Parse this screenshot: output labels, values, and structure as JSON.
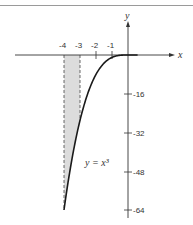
{
  "chart_data": {
    "type": "line",
    "title": "",
    "xlabel": "x",
    "ylabel": "y",
    "xlim": [
      -4.2,
      2.8
    ],
    "ylim": [
      -66,
      8
    ],
    "grid": false,
    "series": [
      {
        "name": "y = x^3",
        "x": [
          -4,
          -3.5,
          -3,
          -2.5,
          -2,
          -1.5,
          -1,
          -0.5,
          0
        ],
        "values": [
          -64,
          -42.875,
          -27,
          -15.625,
          -8,
          -3.375,
          -1,
          -0.125,
          0
        ]
      }
    ],
    "x_ticks": [
      {
        "value": -4,
        "label": "-4"
      },
      {
        "value": -3,
        "label": "-3"
      },
      {
        "value": -2,
        "label": "-2"
      },
      {
        "value": -1,
        "label": "-1"
      }
    ],
    "y_ticks": [
      {
        "value": -16,
        "label": "-16"
      },
      {
        "value": -32,
        "label": "-32"
      },
      {
        "value": -48,
        "label": "-48"
      },
      {
        "value": -64,
        "label": "-64"
      }
    ],
    "shaded_region": {
      "x_from": -4,
      "x_to": -3,
      "between": "x-axis and curve",
      "boundary_style": "dashed"
    },
    "annotations": [
      {
        "text": "y = x³",
        "x": -2.3,
        "y": -44
      }
    ]
  },
  "labels": {
    "x_axis": "x",
    "y_axis": "y",
    "equation": "y = x³",
    "x_ticks": [
      "-4",
      "-3",
      "-2",
      "-1"
    ],
    "y_ticks": [
      "-16",
      "-32",
      "-48",
      "-64"
    ]
  },
  "colors": {
    "curve": "#1a1a1a",
    "axis": "#333333",
    "shade": "#dcdcdc"
  }
}
